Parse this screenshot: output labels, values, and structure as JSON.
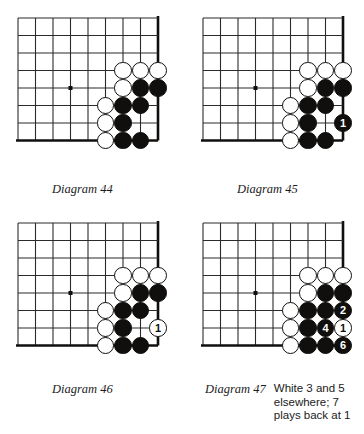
{
  "page": {
    "background_color": "#ffffff",
    "ink_color": "#100f0d",
    "grid_color": "#2b2b2b"
  },
  "board": {
    "columns": 9,
    "rows": 8,
    "cell_size": 17.5,
    "star_point": {
      "col": 4,
      "row": 5
    },
    "edges": {
      "right": true,
      "bottom": true
    }
  },
  "diagrams": [
    {
      "id": "diagram-44",
      "caption": "Diagram 44",
      "note_lines": [],
      "stones": [
        {
          "color": "white",
          "col": 7,
          "row": 4,
          "label": ""
        },
        {
          "color": "white",
          "col": 8,
          "row": 4,
          "label": ""
        },
        {
          "color": "white",
          "col": 9,
          "row": 4,
          "label": ""
        },
        {
          "color": "white",
          "col": 7,
          "row": 5,
          "label": ""
        },
        {
          "color": "black",
          "col": 8,
          "row": 5,
          "label": ""
        },
        {
          "color": "black",
          "col": 9,
          "row": 5,
          "label": ""
        },
        {
          "color": "white",
          "col": 6,
          "row": 6,
          "label": ""
        },
        {
          "color": "black",
          "col": 7,
          "row": 6,
          "label": ""
        },
        {
          "color": "black",
          "col": 8,
          "row": 6,
          "label": ""
        },
        {
          "color": "white",
          "col": 6,
          "row": 7,
          "label": ""
        },
        {
          "color": "black",
          "col": 7,
          "row": 7,
          "label": ""
        },
        {
          "color": "white",
          "col": 6,
          "row": 8,
          "label": ""
        },
        {
          "color": "black",
          "col": 7,
          "row": 8,
          "label": ""
        },
        {
          "color": "black",
          "col": 8,
          "row": 8,
          "label": ""
        }
      ]
    },
    {
      "id": "diagram-45",
      "caption": "Diagram 45",
      "note_lines": [],
      "stones": [
        {
          "color": "white",
          "col": 7,
          "row": 4,
          "label": ""
        },
        {
          "color": "white",
          "col": 8,
          "row": 4,
          "label": ""
        },
        {
          "color": "white",
          "col": 9,
          "row": 4,
          "label": ""
        },
        {
          "color": "white",
          "col": 7,
          "row": 5,
          "label": ""
        },
        {
          "color": "black",
          "col": 8,
          "row": 5,
          "label": ""
        },
        {
          "color": "black",
          "col": 9,
          "row": 5,
          "label": ""
        },
        {
          "color": "white",
          "col": 6,
          "row": 6,
          "label": ""
        },
        {
          "color": "black",
          "col": 7,
          "row": 6,
          "label": ""
        },
        {
          "color": "black",
          "col": 8,
          "row": 6,
          "label": ""
        },
        {
          "color": "white",
          "col": 6,
          "row": 7,
          "label": ""
        },
        {
          "color": "black",
          "col": 7,
          "row": 7,
          "label": ""
        },
        {
          "color": "black",
          "col": 9,
          "row": 7,
          "label": "1"
        },
        {
          "color": "white",
          "col": 6,
          "row": 8,
          "label": ""
        },
        {
          "color": "black",
          "col": 7,
          "row": 8,
          "label": ""
        },
        {
          "color": "black",
          "col": 8,
          "row": 8,
          "label": ""
        }
      ]
    },
    {
      "id": "diagram-46",
      "caption": "Diagram 46",
      "note_lines": [],
      "stones": [
        {
          "color": "white",
          "col": 7,
          "row": 4,
          "label": ""
        },
        {
          "color": "white",
          "col": 8,
          "row": 4,
          "label": ""
        },
        {
          "color": "white",
          "col": 9,
          "row": 4,
          "label": ""
        },
        {
          "color": "white",
          "col": 7,
          "row": 5,
          "label": ""
        },
        {
          "color": "black",
          "col": 8,
          "row": 5,
          "label": ""
        },
        {
          "color": "black",
          "col": 9,
          "row": 5,
          "label": ""
        },
        {
          "color": "white",
          "col": 6,
          "row": 6,
          "label": ""
        },
        {
          "color": "black",
          "col": 7,
          "row": 6,
          "label": ""
        },
        {
          "color": "black",
          "col": 8,
          "row": 6,
          "label": ""
        },
        {
          "color": "white",
          "col": 6,
          "row": 7,
          "label": ""
        },
        {
          "color": "black",
          "col": 7,
          "row": 7,
          "label": ""
        },
        {
          "color": "white",
          "col": 9,
          "row": 7,
          "label": "1"
        },
        {
          "color": "white",
          "col": 6,
          "row": 8,
          "label": ""
        },
        {
          "color": "black",
          "col": 7,
          "row": 8,
          "label": ""
        },
        {
          "color": "black",
          "col": 8,
          "row": 8,
          "label": ""
        }
      ]
    },
    {
      "id": "diagram-47",
      "caption": "Diagram 47",
      "note_lines": [
        "White 3 and 5",
        "elsewhere; 7",
        "plays back at 1"
      ],
      "stones": [
        {
          "color": "white",
          "col": 7,
          "row": 4,
          "label": ""
        },
        {
          "color": "white",
          "col": 8,
          "row": 4,
          "label": ""
        },
        {
          "color": "white",
          "col": 9,
          "row": 4,
          "label": ""
        },
        {
          "color": "white",
          "col": 7,
          "row": 5,
          "label": ""
        },
        {
          "color": "black",
          "col": 8,
          "row": 5,
          "label": ""
        },
        {
          "color": "black",
          "col": 9,
          "row": 5,
          "label": ""
        },
        {
          "color": "white",
          "col": 6,
          "row": 6,
          "label": ""
        },
        {
          "color": "black",
          "col": 7,
          "row": 6,
          "label": ""
        },
        {
          "color": "black",
          "col": 8,
          "row": 6,
          "label": ""
        },
        {
          "color": "black",
          "col": 9,
          "row": 6,
          "label": "2"
        },
        {
          "color": "white",
          "col": 6,
          "row": 7,
          "label": ""
        },
        {
          "color": "black",
          "col": 7,
          "row": 7,
          "label": ""
        },
        {
          "color": "black",
          "col": 8,
          "row": 7,
          "label": "4"
        },
        {
          "color": "white",
          "col": 9,
          "row": 7,
          "label": "1"
        },
        {
          "color": "white",
          "col": 6,
          "row": 8,
          "label": ""
        },
        {
          "color": "black",
          "col": 7,
          "row": 8,
          "label": ""
        },
        {
          "color": "black",
          "col": 8,
          "row": 8,
          "label": ""
        },
        {
          "color": "black",
          "col": 9,
          "row": 8,
          "label": "6"
        }
      ]
    }
  ]
}
